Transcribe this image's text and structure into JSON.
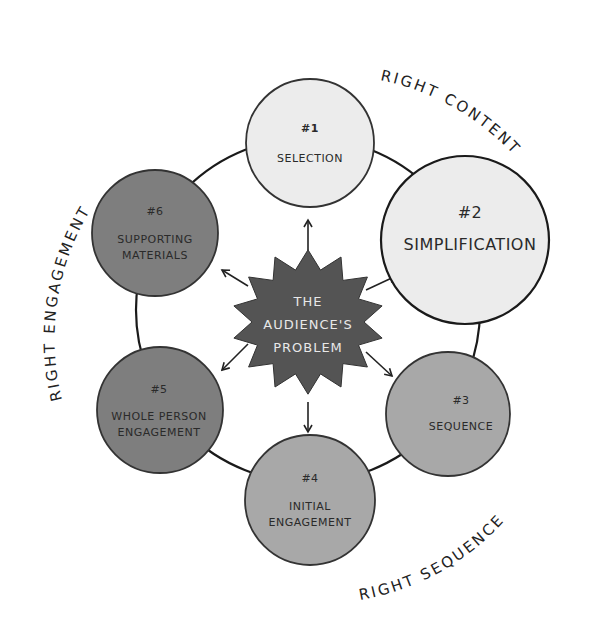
{
  "diagram": {
    "center": {
      "lines": [
        "THE",
        "AUDIENCE'S",
        "PROBLEM"
      ],
      "fill": "#545454"
    },
    "nodes": [
      {
        "number": "#1",
        "lines": [
          "SELECTION"
        ],
        "fill": "#ececec"
      },
      {
        "number": "#2",
        "lines": [
          "SIMPLIFICATION"
        ],
        "fill": "#ececec"
      },
      {
        "number": "#3",
        "lines": [
          "SEQUENCE"
        ],
        "fill": "#a8a8a8"
      },
      {
        "number": "#4",
        "lines": [
          "INITIAL",
          "ENGAGEMENT"
        ],
        "fill": "#a8a8a8"
      },
      {
        "number": "#5",
        "lines": [
          "WHOLE PERSON",
          "ENGAGEMENT"
        ],
        "fill": "#7e7e7e"
      },
      {
        "number": "#6",
        "lines": [
          "SUPPORTING",
          "MATERIALS"
        ],
        "fill": "#7e7e7e"
      }
    ],
    "arc_labels": {
      "content": "RIGHT CONTENT",
      "sequence": "RIGHT SEQUENCE",
      "engagement": "RIGHT ENGAGEMENT"
    }
  }
}
